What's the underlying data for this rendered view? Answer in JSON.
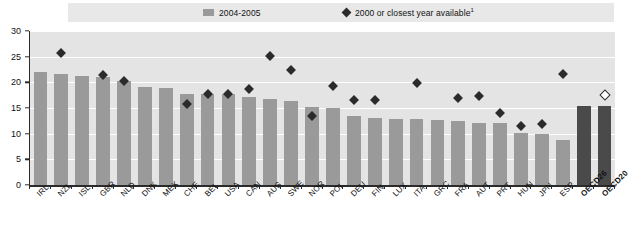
{
  "legend": {
    "bar_label": "2004-2005",
    "diamond_label": "2000 or closest year available",
    "diamond_label_footnote": "1",
    "bar_swatch_color": "#9a9a9a",
    "diamond_color": "#2b2b2b"
  },
  "axis": {
    "y_ticks": [
      "0",
      "5",
      "10",
      "15",
      "20",
      "25",
      "30"
    ],
    "y_min": 0,
    "y_max": 30
  },
  "chart_data": {
    "type": "bar",
    "title": "",
    "subtitle": "",
    "xlabel": "",
    "ylabel": "",
    "ylim": [
      0,
      30
    ],
    "y_ticks": [
      0,
      5,
      10,
      15,
      20,
      25,
      30
    ],
    "grid": "horizontal-white",
    "legend_position": "top",
    "categories": [
      "IRL",
      "NZL",
      "ISL",
      "GBR",
      "NLD",
      "DNK",
      "MEX",
      "CHE",
      "BEL",
      "USA",
      "CAN",
      "AUS",
      "SWE",
      "NOR",
      "POL",
      "DEU",
      "FIN",
      "LUX",
      "ITA",
      "GRC",
      "FRA",
      "AUT",
      "PRT",
      "HUN",
      "JPN",
      "ESP",
      "OECD26",
      "OECD20"
    ],
    "series": [
      {
        "name": "2004-2005",
        "type": "bar",
        "color": "#9a9a9a",
        "values": [
          22.0,
          21.7,
          21.2,
          21.1,
          20.2,
          19.0,
          18.9,
          17.7,
          17.8,
          17.7,
          17.2,
          16.7,
          16.4,
          15.2,
          15.1,
          13.5,
          13.0,
          12.8,
          12.8,
          12.6,
          12.4,
          12.0,
          12.0,
          10.1,
          10.0,
          8.8,
          15.4,
          15.4
        ]
      },
      {
        "name": "2000 or closest year available",
        "type": "scatter",
        "marker": "diamond",
        "color": "#2b2b2b",
        "points": [
          {
            "category": "NZL",
            "value": 25.8,
            "filled": true
          },
          {
            "category": "GBR",
            "value": 21.5,
            "filled": true
          },
          {
            "category": "NLD",
            "value": 20.3,
            "filled": true
          },
          {
            "category": "CHE",
            "value": 15.7,
            "filled": true
          },
          {
            "category": "BEL",
            "value": 17.8,
            "filled": true
          },
          {
            "category": "USA",
            "value": 17.8,
            "filled": true
          },
          {
            "category": "CAN",
            "value": 18.7,
            "filled": true
          },
          {
            "category": "AUS",
            "value": 25.2,
            "filled": true
          },
          {
            "category": "SWE",
            "value": 22.4,
            "filled": true
          },
          {
            "category": "NOR",
            "value": 13.5,
            "filled": true
          },
          {
            "category": "POL",
            "value": 19.2,
            "filled": true
          },
          {
            "category": "DEU",
            "value": 16.6,
            "filled": true
          },
          {
            "category": "FIN",
            "value": 16.5,
            "filled": true
          },
          {
            "category": "ITA",
            "value": 19.9,
            "filled": true
          },
          {
            "category": "FRA",
            "value": 16.9,
            "filled": true
          },
          {
            "category": "AUT",
            "value": 17.3,
            "filled": true
          },
          {
            "category": "PRT",
            "value": 14.0,
            "filled": true
          },
          {
            "category": "HUN",
            "value": 11.4,
            "filled": true
          },
          {
            "category": "JPN",
            "value": 11.8,
            "filled": true
          },
          {
            "category": "ESP",
            "value": 21.6,
            "filled": true
          },
          {
            "category": "OECD20",
            "value": 17.5,
            "filled": false
          }
        ]
      }
    ],
    "bold_categories": [
      "OECD26",
      "OECD20"
    ]
  }
}
